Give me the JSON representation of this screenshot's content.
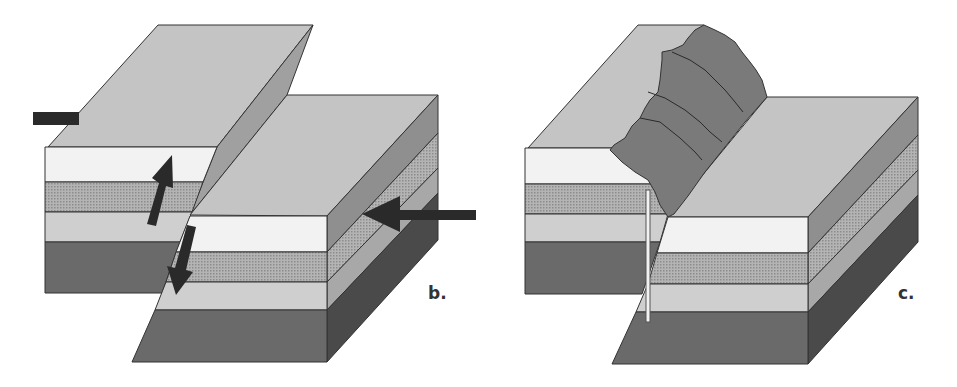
{
  "figure": {
    "panels": [
      {
        "id": "b",
        "label": "b.",
        "description": "Block diagram of a fault with arrows showing relative displacement and compression",
        "arrows": [
          "up-left-block",
          "down-right-block",
          "compression-right",
          "compression-left"
        ]
      },
      {
        "id": "c",
        "label": "c.",
        "description": "Block diagram of eroded fault scarp with borehole/marker line"
      }
    ],
    "colors": {
      "top_surface": "#c4c4c4",
      "layer_white": "#f2f2f2",
      "layer_dotted": "#a8a8a8",
      "layer_light": "#cfcfcf",
      "layer_dark": "#6a6a6a",
      "side_mid": "#8f8f8f",
      "side_dark": "#4a4a4a",
      "fault_plane": "#a0a0a0",
      "scarp": "#7a7a7a",
      "arrow": "#2a2a2a",
      "outline": "#333333"
    }
  }
}
